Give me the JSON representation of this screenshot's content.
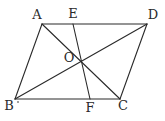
{
  "figure": {
    "type": "parallelogram with diagonals and a line through intersection",
    "points": {
      "A": {
        "x": 42,
        "y": 24,
        "label": "A",
        "lx": 37,
        "ly": 19
      },
      "E": {
        "x": 73,
        "y": 24,
        "label": "E",
        "lx": 73,
        "ly": 18
      },
      "D": {
        "x": 147,
        "y": 24,
        "label": "D",
        "lx": 153,
        "ly": 19
      },
      "B": {
        "x": 15,
        "y": 99,
        "label": "B",
        "lx": 9,
        "ly": 110
      },
      "F": {
        "x": 90,
        "y": 99,
        "label": "F",
        "lx": 90,
        "ly": 112
      },
      "C": {
        "x": 120,
        "y": 99,
        "label": "C",
        "lx": 123,
        "ly": 110
      },
      "O": {
        "x": 81,
        "y": 61,
        "label": "O",
        "lx": 69,
        "ly": 62
      }
    },
    "segments": [
      [
        "A",
        "D"
      ],
      [
        "D",
        "C"
      ],
      [
        "C",
        "B"
      ],
      [
        "B",
        "A"
      ],
      [
        "A",
        "C"
      ],
      [
        "B",
        "D"
      ],
      [
        "E",
        "F"
      ]
    ],
    "stroke_color": "#2a2a2a"
  }
}
